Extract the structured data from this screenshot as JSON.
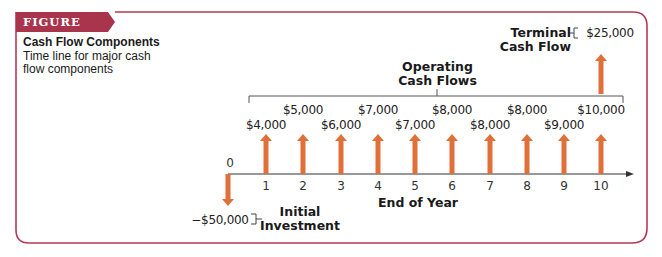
{
  "figure": {
    "label": "FIGURE 11.1",
    "title": "Cash Flow Components",
    "subtitle": "Time line for major cash flow components"
  },
  "colors": {
    "frame": "#b33a55",
    "banner": "#a9354d",
    "arrow": "#e0703a",
    "axis": "#333333"
  },
  "labels": {
    "operating": [
      "Operating",
      "Cash Flows"
    ],
    "terminal": [
      "Terminal",
      "Cash Flow"
    ],
    "terminal_value": "$25,000",
    "initial": [
      "Initial",
      "Investment"
    ],
    "initial_value": "−$50,000",
    "axis_label": "End of Year",
    "zero": "0"
  },
  "chart_data": {
    "type": "timeline",
    "title": "Cash Flow Components",
    "xlabel": "End of Year",
    "x": [
      0,
      1,
      2,
      3,
      4,
      5,
      6,
      7,
      8,
      9,
      10
    ],
    "initial_investment": {
      "year": 0,
      "value": -50000,
      "label": "−$50,000"
    },
    "operating_cash_flows": [
      {
        "year": 1,
        "value": 4000,
        "label": "$4,000"
      },
      {
        "year": 2,
        "value": 5000,
        "label": "$5,000"
      },
      {
        "year": 3,
        "value": 6000,
        "label": "$6,000"
      },
      {
        "year": 4,
        "value": 7000,
        "label": "$7,000"
      },
      {
        "year": 5,
        "value": 7000,
        "label": "$7,000"
      },
      {
        "year": 6,
        "value": 8000,
        "label": "$8,000"
      },
      {
        "year": 7,
        "value": 8000,
        "label": "$8,000"
      },
      {
        "year": 8,
        "value": 8000,
        "label": "$8,000"
      },
      {
        "year": 9,
        "value": 9000,
        "label": "$9,000"
      },
      {
        "year": 10,
        "value": 10000,
        "label": "$10,000"
      }
    ],
    "terminal_cash_flow": {
      "year": 10,
      "value": 25000,
      "label": "$25,000"
    }
  }
}
